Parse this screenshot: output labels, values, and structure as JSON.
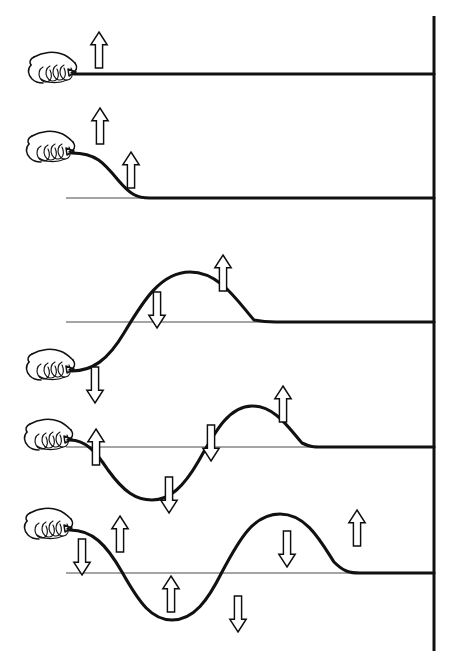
{
  "figure": {
    "title": "Transverse wave pulse travelling along a rope fixed to a wall",
    "width": 470,
    "height": 666,
    "background_color": "#ffffff",
    "ink_color": "#111111",
    "arrow_fill_color": "#ffffff",
    "arrow_outline_color": "#0d0d0d",
    "reference_line_color": "#4a4a4a"
  },
  "wall": {
    "name": "fixed-end-wall",
    "x": 434,
    "y_top": 16,
    "y_bottom": 651,
    "stroke_width": 3
  },
  "frames": [
    {
      "id": "frame-1",
      "index": 1,
      "label": "Rope at rest, hand about to move up",
      "baseline_y": 74,
      "hand": {
        "x": 62,
        "y": 68,
        "scale": 1.0,
        "state": "at-rest"
      },
      "rope_path": "M 74 74 L 434 74",
      "reference_line": null,
      "arrows": [
        {
          "id": "f1-a1",
          "direction": "up",
          "x": 99,
          "y": 50,
          "height": 36,
          "label": "hand-velocity-up"
        }
      ]
    },
    {
      "id": "frame-2",
      "index": 2,
      "label": "Hand raised, leading edge of pulse formed",
      "baseline_y": 198,
      "hand": {
        "x": 60,
        "y": 148,
        "scale": 1.0,
        "state": "raised"
      },
      "rope_path": "M 72 153 C 96 153 104 163 118 180 C 130 194 136 198 150 198 L 434 198",
      "reference_line": {
        "x1": 66,
        "x2": 434,
        "y": 198
      },
      "arrows": [
        {
          "id": "f2-a1",
          "direction": "up",
          "x": 100,
          "y": 122,
          "height": 38,
          "label": "hand-velocity-up"
        },
        {
          "id": "f2-a2",
          "direction": "up",
          "x": 131,
          "y": 153,
          "height": 38,
          "label": "segment-velocity-up"
        }
      ]
    },
    {
      "id": "frame-3",
      "index": 3,
      "label": "Crest has travelled along the rope; hand now moving down",
      "baseline_y": 322,
      "hand": {
        "x": 60,
        "y": 369,
        "scale": 1.0,
        "state": "lowered"
      },
      "rope_path": "M 72 371 C 92 371 108 360 124 333 C 142 303 160 272 190 272 C 220 272 238 302 254 320 C 264 322 268 322 276 322 L 434 322",
      "reference_line": {
        "x1": 66,
        "x2": 434,
        "y": 322
      },
      "arrows": [
        {
          "id": "f3-a1",
          "direction": "up",
          "x": 223,
          "y": 248,
          "height": 40,
          "label": "crest-velocity-up"
        },
        {
          "id": "f3-a2",
          "direction": "down",
          "x": 157,
          "y": 300,
          "height": 38,
          "label": "rising-flank-velocity-down"
        },
        {
          "id": "f3-a3",
          "direction": "down",
          "x": 95,
          "y": 368,
          "height": 38,
          "label": "hand-velocity-down"
        }
      ]
    },
    {
      "id": "frame-4",
      "index": 4,
      "label": "Hand back at the line; one full trough and crest on the rope",
      "baseline_y": 447,
      "hand": {
        "x": 58,
        "y": 432,
        "scale": 1.0,
        "state": "at-line"
      },
      "rope_path": "M 70 440 C 86 440 96 452 108 470 C 124 492 136 500 152 500 C 170 500 184 486 198 462 C 214 434 228 406 252 406 C 276 406 290 430 302 443 C 310 447 314 447 322 447 L 434 447",
      "reference_line": {
        "x1": 66,
        "x2": 434,
        "y": 447
      },
      "arrows": [
        {
          "id": "f4-a1",
          "direction": "up",
          "x": 96,
          "y": 426,
          "height": 40,
          "label": "hand-velocity-up"
        },
        {
          "id": "f4-a2",
          "direction": "down",
          "x": 169,
          "y": 480,
          "height": 40,
          "label": "trough-tail-velocity-down"
        },
        {
          "id": "f4-a3",
          "direction": "down",
          "x": 211,
          "y": 425,
          "height": 40,
          "label": "crest-front-velocity-down"
        },
        {
          "id": "f4-a4",
          "direction": "up",
          "x": 283,
          "y": 386,
          "height": 40,
          "label": "crest-velocity-up"
        }
      ]
    },
    {
      "id": "frame-5",
      "index": 5,
      "label": "A complete wavelength on the rope, hand continuing to oscillate",
      "baseline_y": 573,
      "hand": {
        "x": 58,
        "y": 528,
        "scale": 1.0,
        "state": "raised"
      },
      "rope_path": "M 70 530 C 92 530 106 544 122 572 C 140 604 152 620 172 620 C 194 620 208 600 222 572 C 240 538 254 514 280 514 C 306 514 320 540 334 562 C 344 572 350 573 360 573 L 434 573",
      "reference_line": {
        "x1": 66,
        "x2": 434,
        "y": 573
      },
      "arrows": [
        {
          "id": "f5-a1",
          "direction": "down",
          "x": 82,
          "y": 540,
          "height": 40,
          "label": "hand-side-velocity-down"
        },
        {
          "id": "f5-a2",
          "direction": "up",
          "x": 120,
          "y": 515,
          "height": 40,
          "label": "descending-flank-velocity-up"
        },
        {
          "id": "f5-a3",
          "direction": "up",
          "x": 170,
          "y": 578,
          "height": 40,
          "label": "trough-velocity-up"
        },
        {
          "id": "f5-a4",
          "direction": "down",
          "x": 238,
          "y": 600,
          "height": 40,
          "label": "rising-flank-velocity-down"
        },
        {
          "id": "f5-a5",
          "direction": "down",
          "x": 286,
          "y": 535,
          "height": 40,
          "label": "crest-front-velocity-down"
        },
        {
          "id": "f5-a6",
          "direction": "up",
          "x": 357,
          "y": 512,
          "height": 40,
          "label": "crest-velocity-up"
        }
      ]
    }
  ],
  "legend": {
    "arrow_up_meaning": "segment moving upward",
    "arrow_down_meaning": "segment moving downward",
    "rope_meaning": "rope displacement shape at this instant",
    "wall_meaning": "rigid fixed end"
  }
}
